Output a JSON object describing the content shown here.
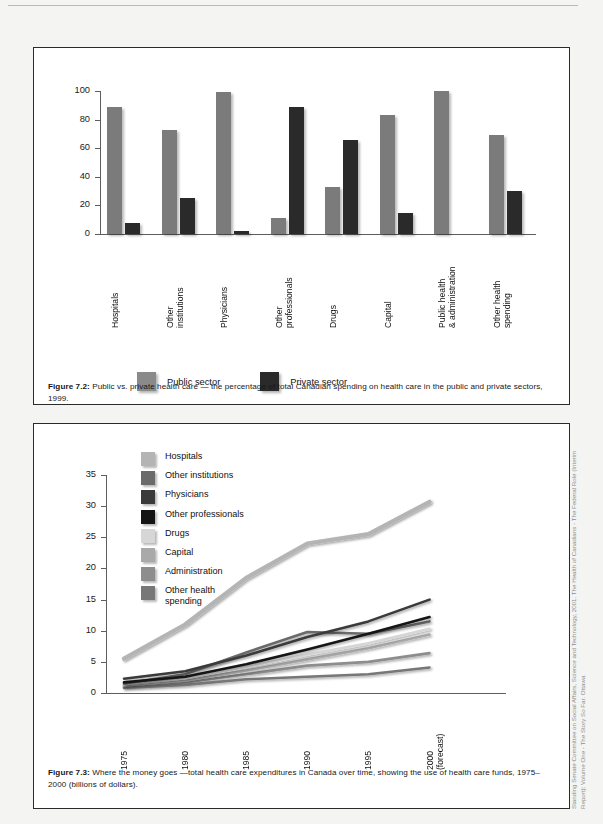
{
  "page": {
    "credit": "Standing Senate Committee on Social Affairs, Science and Technology, 2001. The Health of Canadians - The Federal Role (Interim Report): Volume One - The Story So Far. Ottawa"
  },
  "figure_72": {
    "caption_label": "Figure 7.2:",
    "caption_text": " Public vs. private health care — the percentage of total Canadian spending on health care in the public and private sectors, 1999.",
    "legend": [
      {
        "label": "Public sector",
        "color": "#8a8a8a"
      },
      {
        "label": "Private sector",
        "color": "#2a2a2a"
      }
    ]
  },
  "figure_73": {
    "caption_label": "Figure 7.3:",
    "caption_text": " Where the money goes —total health care expenditures in Canada over time, showing the use of health care funds, 1975–2000 (billions of dollars)."
  },
  "chart_data": [
    {
      "type": "bar",
      "title": "Public vs. private health care",
      "xlabel": "",
      "ylabel": "",
      "ylim": [
        0,
        100
      ],
      "yticks": [
        0,
        20,
        40,
        60,
        80,
        100
      ],
      "grid": false,
      "legend_position": "bottom-left",
      "categories": [
        "Hospitals",
        "Other\ninstitutions",
        "Physicians",
        "Other\nprofessionals",
        "Drugs",
        "Capital",
        "Public health\n& administration",
        "Other health\nspending"
      ],
      "series": [
        {
          "name": "Public sector",
          "color": "#7b7b7b",
          "values": [
            89,
            73,
            99,
            11,
            33,
            83,
            100,
            69
          ]
        },
        {
          "name": "Private sector",
          "color": "#2a2a2a",
          "values": [
            8,
            25,
            2,
            89,
            66,
            15,
            0,
            30
          ]
        }
      ]
    },
    {
      "type": "line",
      "title": "Where the money goes",
      "xlabel": "",
      "ylabel": "",
      "ylim": [
        0,
        35
      ],
      "yticks": [
        0,
        5,
        10,
        15,
        20,
        25,
        30,
        35
      ],
      "grid": false,
      "legend_position": "top-left",
      "x": [
        "1975",
        "1980",
        "1985",
        "1990",
        "1995",
        "2000\n(forecast)"
      ],
      "series": [
        {
          "name": "Hospitals",
          "color": "#b4b4b4",
          "values": [
            5.5,
            11.0,
            18.5,
            24.0,
            25.5,
            30.7
          ]
        },
        {
          "name": "Other institutions",
          "color": "#6a6a6a",
          "values": [
            1.5,
            3.0,
            6.5,
            9.8,
            9.5,
            11.5
          ]
        },
        {
          "name": "Physicians",
          "color": "#3a3a3a",
          "values": [
            2.3,
            3.5,
            6.0,
            9.0,
            11.5,
            15.0
          ]
        },
        {
          "name": "Other professionals",
          "color": "#141414",
          "values": [
            1.7,
            2.6,
            4.6,
            7.0,
            9.5,
            12.2
          ]
        },
        {
          "name": "Drugs",
          "color": "#d6d6d6",
          "values": [
            1.4,
            2.4,
            4.2,
            6.2,
            8.0,
            10.3
          ]
        },
        {
          "name": "Capital",
          "color": "#a9a9a9",
          "values": [
            1.2,
            2.0,
            3.6,
            5.4,
            7.2,
            9.4
          ]
        },
        {
          "name": "Administration",
          "color": "#8d8d8d",
          "values": [
            1.0,
            1.7,
            3.0,
            4.4,
            5.0,
            6.4
          ]
        },
        {
          "name": "Other health spending",
          "color": "#777777",
          "values": [
            0.8,
            1.3,
            2.2,
            2.6,
            3.0,
            4.1
          ]
        }
      ],
      "legend_items": [
        {
          "label": "Hospitals",
          "color": "#b4b4b4"
        },
        {
          "label": "Other institutions",
          "color": "#6a6a6a"
        },
        {
          "label": "Physicians",
          "color": "#3a3a3a"
        },
        {
          "label": "Other professionals",
          "color": "#141414"
        },
        {
          "label": "Drugs",
          "color": "#d6d6d6"
        },
        {
          "label": "Capital",
          "color": "#a9a9a9"
        },
        {
          "label": "Administration",
          "color": "#8d8d8d"
        },
        {
          "label": "Other health\nspending",
          "color": "#777777"
        }
      ]
    }
  ]
}
